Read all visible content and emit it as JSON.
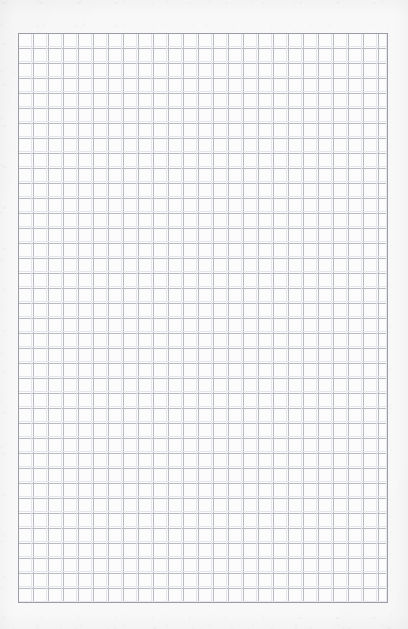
{
  "document": {
    "kind": "grid-paper-scan",
    "description": "Blank quadrille-ruled grid paper, no writing",
    "page_width_px": 408,
    "page_height_px": 629,
    "text_content": "",
    "annotations": []
  },
  "paper": {
    "background_color": "#f8f8f9",
    "grid_fill_color": "#fcfcfd",
    "texture_visible": "true"
  },
  "grid": {
    "left_px": 18,
    "top_px": 33,
    "width_px": 370,
    "height_px": 570,
    "cell_size_px": 15,
    "columns": 25,
    "rows": 38,
    "line_color": "#b9bbc3",
    "line_width_px": 1,
    "ghost_line_color": "#e6e7ec",
    "border_color": "#9b9da7",
    "border_width_px": 1
  }
}
